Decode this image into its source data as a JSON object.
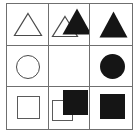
{
  "puzzle": {
    "title": "3x3 shape matrix",
    "grid": {
      "rows": 3,
      "columns": 3,
      "border_color": "#6f6f6f",
      "background_color": "#ffffff"
    },
    "fill_color": "#151515",
    "outline_color": "#4a4a4a",
    "cells": [
      {
        "id": "r1c1",
        "row": 1,
        "column": 1,
        "description": "outlined triangle",
        "shapes": [
          {
            "kind": "triangle",
            "style": "outline"
          }
        ]
      },
      {
        "id": "r1c2",
        "row": 1,
        "column": 2,
        "description": "outlined triangle overlapped by filled triangle offset up-right",
        "shapes": [
          {
            "kind": "triangle",
            "style": "outline"
          },
          {
            "kind": "triangle",
            "style": "filled"
          }
        ]
      },
      {
        "id": "r1c3",
        "row": 1,
        "column": 3,
        "description": "filled triangle",
        "shapes": [
          {
            "kind": "triangle",
            "style": "filled"
          }
        ]
      },
      {
        "id": "r2c1",
        "row": 2,
        "column": 1,
        "description": "outlined circle",
        "shapes": [
          {
            "kind": "circle",
            "style": "outline"
          }
        ]
      },
      {
        "id": "r2c2",
        "row": 2,
        "column": 2,
        "description": "empty cell",
        "shapes": []
      },
      {
        "id": "r2c3",
        "row": 2,
        "column": 3,
        "description": "filled circle",
        "shapes": [
          {
            "kind": "circle",
            "style": "filled"
          }
        ]
      },
      {
        "id": "r3c1",
        "row": 3,
        "column": 1,
        "description": "outlined square",
        "shapes": [
          {
            "kind": "square",
            "style": "outline"
          }
        ]
      },
      {
        "id": "r3c2",
        "row": 3,
        "column": 2,
        "description": "outlined square overlapped by filled square offset up-right",
        "shapes": [
          {
            "kind": "square",
            "style": "outline"
          },
          {
            "kind": "square",
            "style": "filled"
          }
        ]
      },
      {
        "id": "r3c3",
        "row": 3,
        "column": 3,
        "description": "filled square",
        "shapes": [
          {
            "kind": "square",
            "style": "filled"
          }
        ]
      }
    ]
  }
}
